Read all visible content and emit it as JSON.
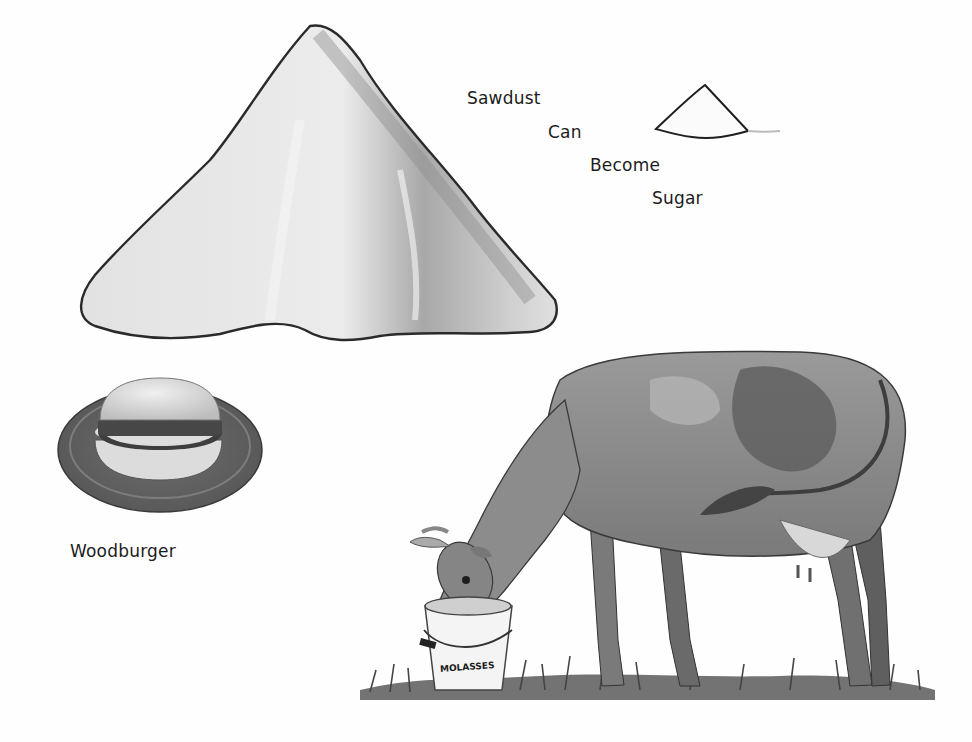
{
  "illustration": {
    "headline_words": [
      {
        "text": "Sawdust",
        "x": 467,
        "y": 88
      },
      {
        "text": "Can",
        "x": 548,
        "y": 122
      },
      {
        "text": "Become",
        "x": 590,
        "y": 155
      },
      {
        "text": "Sugar",
        "x": 652,
        "y": 188
      }
    ],
    "woodburger_caption": "Woodburger",
    "bucket_label": "MOLASSES",
    "colors": {
      "background": "#fefefe",
      "ink": "#1c1c1c",
      "sawdust_fill": "#e4e4e4",
      "sawdust_shadow": "#9a9a9a",
      "cow_body": "#8a8a8a",
      "cow_patch": "#5e5e5e",
      "grass": "#4a4a4a"
    }
  }
}
